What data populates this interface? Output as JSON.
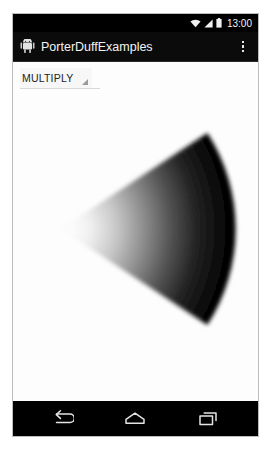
{
  "device": {
    "status_bar": {
      "clock": "13:00",
      "icons": [
        {
          "name": "wifi-icon",
          "label": "wifi"
        },
        {
          "name": "cellular-signal-icon",
          "label": "signal"
        },
        {
          "name": "battery-icon",
          "label": "battery"
        }
      ]
    },
    "action_bar": {
      "app_icon": "android-robot-icon",
      "title": "PorterDuffExamples",
      "overflow_menu": "overflow-menu-icon"
    },
    "content": {
      "spinner": {
        "selected": "MULTIPLY",
        "dropdown_icon": "dropdown-triangle-icon"
      },
      "graphic": {
        "description": "pie-wedge-gradient",
        "background_color": "#fdfdfd",
        "gradient_light": "#f2f2f2",
        "gradient_dark": "#000000"
      }
    },
    "navigation_bar": {
      "buttons": [
        {
          "name": "nav-back-button",
          "label": "Back"
        },
        {
          "name": "nav-home-button",
          "label": "Home"
        },
        {
          "name": "nav-recents-button",
          "label": "Recents"
        }
      ]
    }
  },
  "colors": {
    "frame": "#000000",
    "frame_border": "#bdbdbd",
    "status_bar_bg": "#000000",
    "action_bar_bg": "#0b0b0b",
    "content_bg": "#fdfdfd",
    "nav_bar_bg": "#000000",
    "text_light": "#f4f4f4",
    "text_dark": "#1d1d1d"
  }
}
